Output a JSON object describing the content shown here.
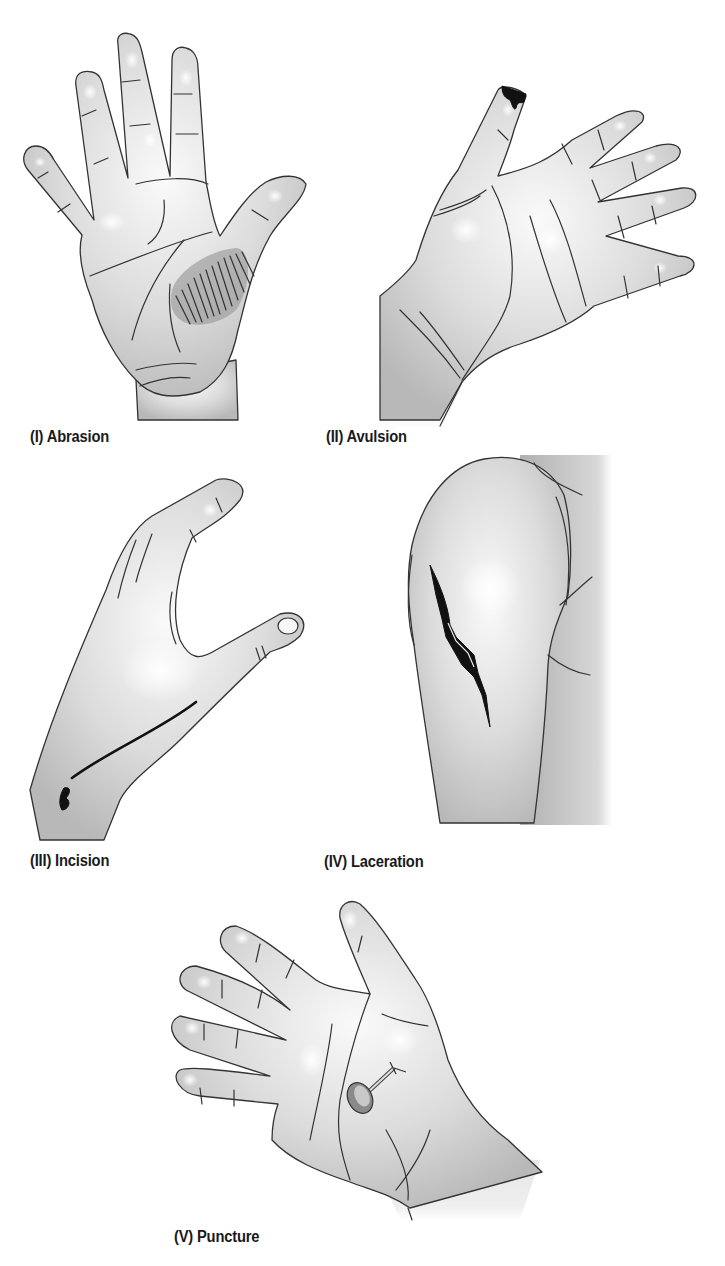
{
  "figure": {
    "panels": [
      {
        "id": "I",
        "label": "(I) Abrasion",
        "subject": "palm of hand with scraped area at thenar eminence",
        "wound_type": "abrasion"
      },
      {
        "id": "II",
        "label": "(II) Avulsion",
        "subject": "hand with fingertip torn away on thumb",
        "wound_type": "avulsion"
      },
      {
        "id": "III",
        "label": "(III) Incision",
        "subject": "side of hand with clean straight cut toward wrist",
        "wound_type": "incision"
      },
      {
        "id": "IV",
        "label": "(IV) Laceration",
        "subject": "shoulder / upper arm with jagged tear",
        "wound_type": "laceration"
      },
      {
        "id": "V",
        "label": "(V) Puncture",
        "subject": "palm of hand pierced by a nail",
        "wound_type": "puncture"
      }
    ],
    "colors": {
      "skin_light": "#f4f4f4",
      "skin_shade": "#bdbdbd",
      "outline": "#333333",
      "wound": "#111111",
      "abrasion_patch": "#9a9a9a",
      "label_text": "#1a1a1a"
    }
  }
}
